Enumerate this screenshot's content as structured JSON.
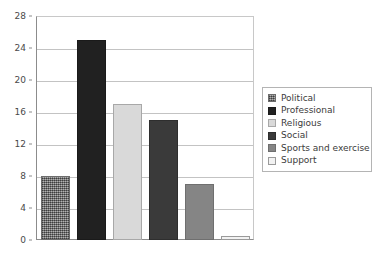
{
  "chart_data": {
    "type": "bar",
    "title": "",
    "xlabel": "",
    "ylabel": "",
    "categories": [
      "Political",
      "Professional",
      "Religious",
      "Social",
      "Sports and exercise",
      "Support"
    ],
    "values": [
      8,
      25,
      17,
      15,
      7,
      0.5
    ],
    "ylim": [
      0,
      28
    ],
    "yticks": [
      0,
      4,
      8,
      12,
      16,
      20,
      24,
      28
    ],
    "ytick_labels": [
      "0",
      "4",
      "8",
      "12",
      "16",
      "20",
      "24",
      "28"
    ],
    "grid": "horizontal",
    "legend_position": "right",
    "series": [
      {
        "name": "counts",
        "values": [
          8,
          25,
          17,
          15,
          7,
          0.5
        ]
      }
    ],
    "colors": [
      "#808080",
      "#212121",
      "#d9d9d9",
      "#3a3a3a",
      "#858585",
      "#f2f2f2"
    ]
  },
  "legend": {
    "items": [
      {
        "label": "Political",
        "swatch_class": "fill-political"
      },
      {
        "label": "Professional",
        "swatch_class": "fill-professional"
      },
      {
        "label": "Religious",
        "swatch_class": "fill-religious"
      },
      {
        "label": "Social",
        "swatch_class": "fill-social"
      },
      {
        "label": "Sports and exercise",
        "swatch_class": "fill-sports"
      },
      {
        "label": "Support",
        "swatch_class": "fill-support"
      }
    ]
  }
}
